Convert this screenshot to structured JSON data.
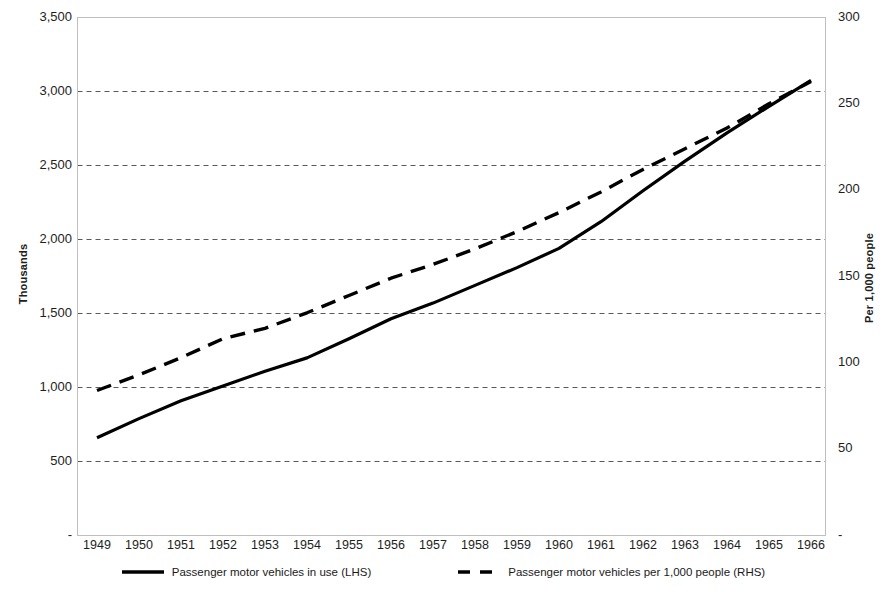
{
  "chart_data": {
    "type": "line",
    "title": "",
    "subtitle": "",
    "xlabel": "",
    "ylabel": "Thousands",
    "y2label": "Per 1,000 people",
    "grid": true,
    "legend_position": "bottom",
    "x": [
      1949,
      1950,
      1951,
      1952,
      1953,
      1954,
      1955,
      1956,
      1957,
      1958,
      1959,
      1960,
      1961,
      1962,
      1963,
      1964,
      1965,
      1966
    ],
    "categories": [
      "1949",
      "1950",
      "1951",
      "1952",
      "1953",
      "1954",
      "1955",
      "1956",
      "1957",
      "1958",
      "1959",
      "1960",
      "1961",
      "1962",
      "1963",
      "1964",
      "1965",
      "1966"
    ],
    "ylim": [
      0,
      3500
    ],
    "ytick_labels": [
      "-",
      "500",
      "1,000",
      "1,500",
      "2,000",
      "2,500",
      "3,000",
      "3,500"
    ],
    "ytick_values": [
      0,
      500,
      1000,
      1500,
      2000,
      2500,
      3000,
      3500
    ],
    "y2lim": [
      0,
      300
    ],
    "y2tick_labels": [
      "-",
      "50",
      "100",
      "150",
      "200",
      "250",
      "300"
    ],
    "y2tick_values": [
      0,
      50,
      100,
      150,
      200,
      250,
      300
    ],
    "series": [
      {
        "name": "Passenger motor vehicles in use (LHS)",
        "axis": "left",
        "style": "solid",
        "color": "#000000",
        "values": [
          660,
          790,
          910,
          1010,
          1110,
          1200,
          1330,
          1465,
          1570,
          1690,
          1810,
          1940,
          2120,
          2330,
          2530,
          2720,
          2900,
          3075
        ]
      },
      {
        "name": "Passenger motor vehicles per 1,000 people (RHS)",
        "axis": "right",
        "style": "dashed",
        "color": "#000000",
        "values": [
          84,
          93,
          103,
          114,
          120,
          129,
          139,
          149,
          157,
          166,
          176,
          187,
          199,
          212,
          224,
          236,
          250,
          263
        ]
      }
    ]
  },
  "legend": {
    "items": [
      {
        "label": "Passenger motor vehicles in use (LHS)",
        "style": "solid"
      },
      {
        "label": "Passenger motor vehicles per 1,000 people (RHS)",
        "style": "dashed"
      }
    ]
  },
  "colors": {
    "line": "#000000",
    "grid": "#595959",
    "frame": "#bfbfbf",
    "text": "#1a1a1a"
  }
}
